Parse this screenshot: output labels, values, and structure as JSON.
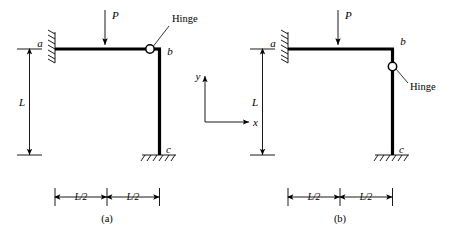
{
  "figure": {
    "panels": [
      {
        "id": "a",
        "caption": "(a)",
        "load_label": "P",
        "hinge_label": "Hinge",
        "hinge_location": "on horizontal beam at joint b",
        "joint_labels": {
          "a": "a",
          "b": "b",
          "c": "c"
        },
        "vertical_dimension_label": "L",
        "horizontal_dimension_labels": [
          "L/2",
          "L/2"
        ],
        "supports": {
          "a": "fixed-wall",
          "c": "fixed-ground"
        }
      },
      {
        "id": "b",
        "caption": "(b)",
        "load_label": "P",
        "hinge_label": "Hinge",
        "hinge_location": "on vertical column just below joint b",
        "joint_labels": {
          "a": "a",
          "b": "b",
          "c": "c"
        },
        "vertical_dimension_label": "L",
        "horizontal_dimension_labels": [
          "L/2",
          "L/2"
        ],
        "supports": {
          "a": "fixed-wall",
          "c": "fixed-ground"
        }
      }
    ],
    "axes": {
      "y_label": "y",
      "x_label": "x"
    },
    "colors": {
      "ink": "#000000",
      "paper": "#ffffff"
    }
  }
}
